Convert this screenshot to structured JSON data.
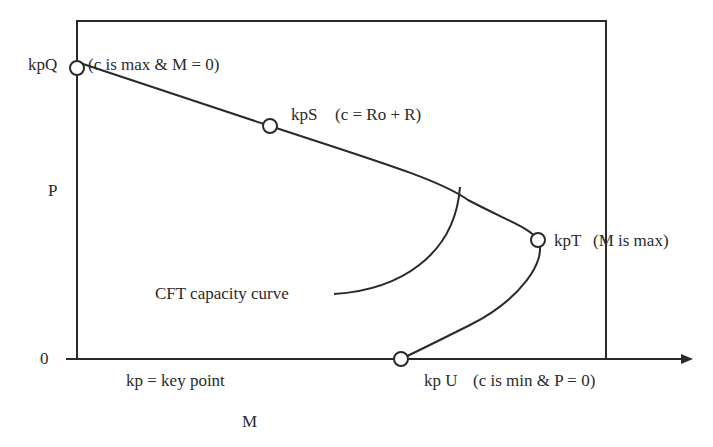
{
  "figure": {
    "y_axis_label": "P",
    "x_axis_label": "M",
    "origin_tick_label": "0",
    "legend_note": "kp = key point",
    "curve_label": "CFT capacity curve",
    "key_points": [
      {
        "id": "kpQ",
        "name": "kpQ",
        "desc": "(c is max & M = 0)"
      },
      {
        "id": "kpS",
        "name": "kpS",
        "desc": "(c = Ro + R)"
      },
      {
        "id": "kpT",
        "name": "kpT",
        "desc": "(M is max)"
      },
      {
        "id": "kpU",
        "name": "kp U",
        "desc": "(c is min & P = 0)"
      }
    ],
    "colors": {
      "line": "#2a2a2a",
      "background": "#ffffff"
    }
  }
}
